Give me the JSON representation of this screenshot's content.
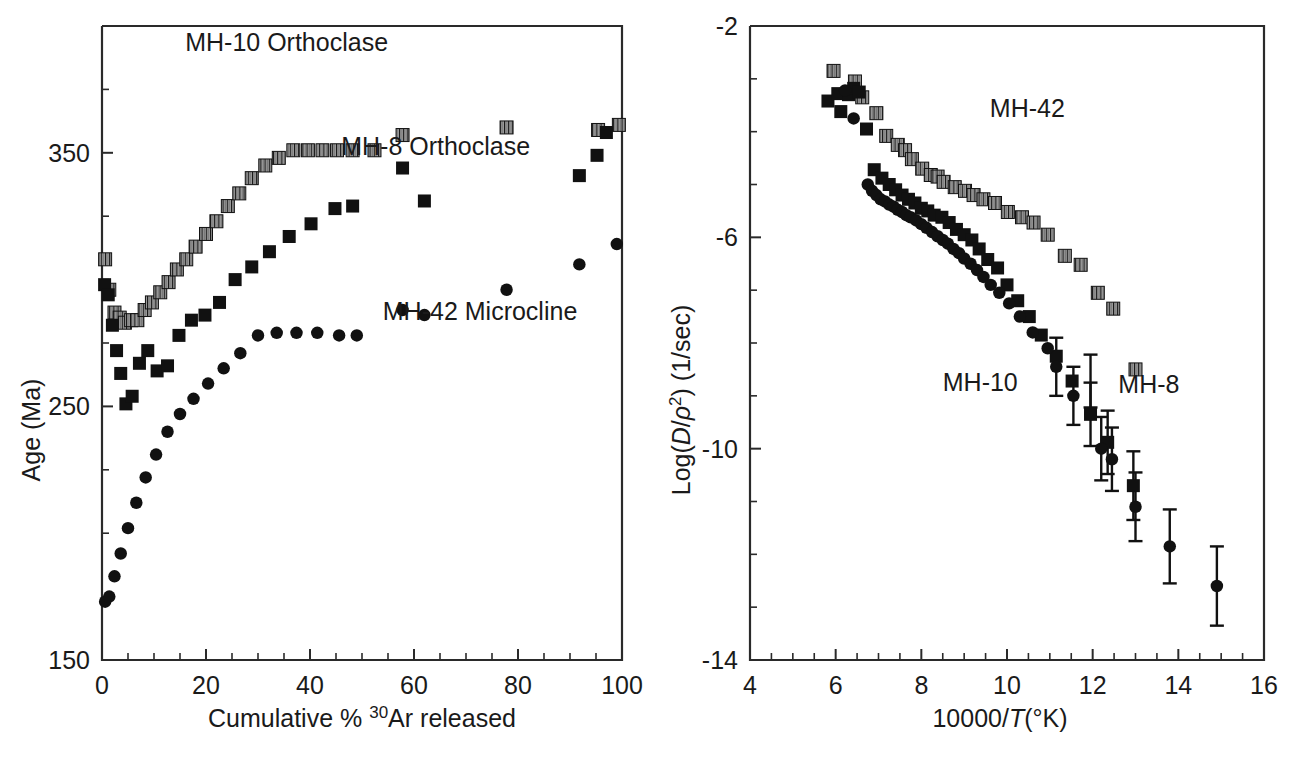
{
  "figure": {
    "background_color": "#ffffff",
    "ink_color": "#1a1a1a",
    "panels": [
      "left",
      "right"
    ]
  },
  "chart_data": [
    {
      "id": "left-panel",
      "type": "scatter",
      "title": "",
      "xlabel": "Cumulative % 30Ar released",
      "xlabel_parts": {
        "pre": "Cumulative % ",
        "sup": "30",
        "post": "Ar released"
      },
      "ylabel": "Age (Ma)",
      "xlim": [
        0,
        100
      ],
      "ylim": [
        150,
        400
      ],
      "xticks": [
        0,
        20,
        40,
        60,
        80,
        100
      ],
      "xticklabels": [
        "0",
        "20",
        "40",
        "60",
        "80",
        "100"
      ],
      "xminor_step": 5,
      "yticks": [
        150,
        250,
        350
      ],
      "yticklabels": [
        "150",
        "250",
        "350"
      ],
      "yminor_step": 25,
      "grid": false,
      "legend_position": "inline-annotations",
      "annotations": [
        {
          "text": "MH-10 Orthoclase",
          "x": 16,
          "y": 390
        },
        {
          "text": "MH-8 Orthoclase",
          "x": 46,
          "y": 349
        },
        {
          "text": "MH-42 Microcline",
          "x": 54,
          "y": 284
        }
      ],
      "series": [
        {
          "name": "MH-10 Orthoclase",
          "marker": "striped-square",
          "x": [
            0.6,
            1.4,
            2.4,
            3.4,
            4.4,
            5.6,
            6.8,
            8.2,
            9.6,
            11.2,
            12.8,
            14.4,
            16.2,
            18.0,
            20.0,
            22.0,
            24.2,
            26.4,
            28.8,
            31.4,
            34.0,
            36.8,
            39.6,
            42.4,
            45.2,
            48.2,
            52.4,
            57.8,
            77.8,
            95.4,
            99.4
          ],
          "y": [
            308,
            296,
            287,
            285,
            283,
            284,
            284,
            288,
            291,
            295,
            299,
            304,
            308,
            313,
            318,
            323,
            329,
            334,
            340,
            345,
            348,
            351,
            351,
            351,
            351,
            351,
            351,
            357,
            360,
            359,
            361
          ]
        },
        {
          "name": "MH-8 Orthoclase",
          "marker": "filled-square",
          "x": [
            0.5,
            1.2,
            2.0,
            2.8,
            3.6,
            4.6,
            5.8,
            7.2,
            8.8,
            10.6,
            12.6,
            14.8,
            17.2,
            19.8,
            22.6,
            25.6,
            28.8,
            32.2,
            36.0,
            40.2,
            44.8,
            48.2,
            57.8,
            62.0,
            91.8,
            95.2,
            97.0
          ],
          "y": [
            298,
            294,
            282,
            272,
            263,
            251,
            254,
            267,
            272,
            264,
            266,
            278,
            284,
            286,
            291,
            300,
            305,
            311,
            317,
            322,
            328,
            329,
            344,
            331,
            341,
            349,
            358
          ]
        },
        {
          "name": "MH-42 Microcline",
          "marker": "filled-circle",
          "x": [
            0.6,
            1.4,
            2.4,
            3.6,
            5.0,
            6.6,
            8.4,
            10.4,
            12.6,
            15.0,
            17.6,
            20.4,
            23.4,
            26.6,
            30.0,
            33.6,
            37.4,
            41.4,
            45.6,
            49.0,
            57.8,
            62.0,
            77.8,
            91.8,
            99.0
          ],
          "y": [
            173,
            175,
            183,
            192,
            202,
            212,
            222,
            231,
            240,
            247,
            253,
            259,
            265,
            271,
            278,
            279,
            279,
            279,
            278,
            278,
            288,
            286,
            296,
            306,
            314
          ]
        }
      ]
    },
    {
      "id": "right-panel",
      "type": "scatter",
      "title": "",
      "xlabel": "10000/T(°K)",
      "xlabel_parts": {
        "pre": "10000/",
        "italic": "T",
        "post": "(°K)"
      },
      "ylabel": "Log(D/ρ²) (1/sec)",
      "ylabel_parts": {
        "pre": "Log(",
        "italic1": "D",
        "slash": "/",
        "italic2": "ρ",
        "sup": "2",
        "post": ") (1/sec)"
      },
      "xlim": [
        4,
        16
      ],
      "ylim": [
        -14,
        -2
      ],
      "xticks": [
        4,
        6,
        8,
        10,
        12,
        14,
        16
      ],
      "xticklabels": [
        "4",
        "6",
        "8",
        "10",
        "12",
        "14",
        "16"
      ],
      "xminor_step": 0.5,
      "yticks": [
        -2,
        -6,
        -10,
        -14
      ],
      "yticklabels": [
        "-2",
        "-6",
        "-10",
        "-14"
      ],
      "yminor_step": 1,
      "grid": false,
      "legend_position": "inline-annotations",
      "annotations": [
        {
          "text": "MH-42",
          "x": 9.6,
          "y": -3.72
        },
        {
          "text": "MH-10",
          "x": 8.5,
          "y": -8.9
        },
        {
          "text": "MH-8",
          "x": 12.6,
          "y": -8.95
        }
      ],
      "series": [
        {
          "name": "MH-42",
          "marker": "striped-square",
          "x": [
            5.95,
            6.45,
            6.62,
            6.95,
            7.18,
            7.45,
            7.62,
            7.78,
            8.02,
            8.22,
            8.38,
            8.52,
            8.78,
            9.02,
            9.22,
            9.45,
            9.72,
            10.02,
            10.35,
            10.62,
            10.95,
            11.35,
            11.72,
            12.12,
            12.48,
            13.0
          ],
          "y": [
            -2.85,
            -3.05,
            -3.35,
            -3.65,
            -4.08,
            -4.25,
            -4.35,
            -4.52,
            -4.7,
            -4.82,
            -4.85,
            -4.95,
            -5.05,
            -5.12,
            -5.2,
            -5.28,
            -5.35,
            -5.52,
            -5.62,
            -5.72,
            -5.95,
            -6.35,
            -6.52,
            -7.05,
            -7.35,
            -8.5
          ]
        },
        {
          "name": "MH-8",
          "marker": "filled-square",
          "x": [
            5.82,
            6.05,
            6.12,
            6.3,
            6.42,
            6.55,
            6.72,
            6.9,
            7.08,
            7.25,
            7.4,
            7.55,
            7.7,
            7.85,
            8.0,
            8.15,
            8.3,
            8.48,
            8.65,
            8.82,
            9.0,
            9.18,
            9.35,
            9.55,
            9.78,
            10.0,
            10.25,
            10.52,
            10.8,
            11.15,
            11.52,
            11.95,
            12.35,
            12.95
          ],
          "y": [
            -3.42,
            -3.28,
            -3.62,
            -3.3,
            -3.18,
            -3.25,
            -3.95,
            -4.72,
            -4.88,
            -5.0,
            -5.1,
            -5.2,
            -5.28,
            -5.35,
            -5.45,
            -5.5,
            -5.58,
            -5.62,
            -5.72,
            -5.85,
            -5.95,
            -6.05,
            -6.22,
            -6.42,
            -6.58,
            -6.9,
            -7.2,
            -7.5,
            -7.85,
            -8.25,
            -8.72,
            -9.35,
            -9.88,
            -10.7
          ]
        },
        {
          "name": "MH-10",
          "marker": "filled-circle",
          "x": [
            6.22,
            6.42,
            6.75,
            6.85,
            6.95,
            7.05,
            7.15,
            7.25,
            7.35,
            7.45,
            7.55,
            7.65,
            7.75,
            7.88,
            8.0,
            8.12,
            8.25,
            8.38,
            8.5,
            8.62,
            8.75,
            8.88,
            9.0,
            9.15,
            9.3,
            9.45,
            9.62,
            9.82,
            10.05,
            10.3,
            10.6,
            10.95,
            11.15,
            11.55,
            11.95,
            12.2,
            12.45,
            13.0,
            13.8,
            14.9
          ],
          "y": [
            -3.22,
            -3.75,
            -5.0,
            -5.12,
            -5.2,
            -5.28,
            -5.32,
            -5.38,
            -5.42,
            -5.48,
            -5.52,
            -5.58,
            -5.62,
            -5.68,
            -5.75,
            -5.82,
            -5.9,
            -5.98,
            -6.05,
            -6.12,
            -6.22,
            -6.3,
            -6.4,
            -6.5,
            -6.62,
            -6.75,
            -6.9,
            -7.05,
            -7.25,
            -7.5,
            -7.8,
            -8.1,
            -8.45,
            -9.0,
            -9.35,
            -10.0,
            -10.2,
            -11.1,
            -11.85,
            -12.6
          ]
        }
      ],
      "errorbars": [
        {
          "series": "MH-10",
          "x": 11.15,
          "y": -8.45,
          "err": 0.55
        },
        {
          "series": "MH-10",
          "x": 11.55,
          "y": -9.0,
          "err": 0.55
        },
        {
          "series": "MH-8",
          "x": 11.95,
          "y": -8.72,
          "err": 0.5
        },
        {
          "series": "MH-10",
          "x": 11.95,
          "y": -9.35,
          "err": 0.6
        },
        {
          "series": "MH-10",
          "x": 12.2,
          "y": -10.0,
          "err": 0.6
        },
        {
          "series": "MH-8",
          "x": 12.35,
          "y": -9.88,
          "err": 0.6
        },
        {
          "series": "MH-10",
          "x": 12.45,
          "y": -10.2,
          "err": 0.6
        },
        {
          "series": "MH-10",
          "x": 13.0,
          "y": -11.1,
          "err": 0.65
        },
        {
          "series": "MH-8",
          "x": 12.95,
          "y": -10.7,
          "err": 0.65
        },
        {
          "series": "MH-10",
          "x": 13.8,
          "y": -11.85,
          "err": 0.7
        },
        {
          "series": "MH-10",
          "x": 14.9,
          "y": -12.6,
          "err": 0.75
        }
      ]
    }
  ]
}
